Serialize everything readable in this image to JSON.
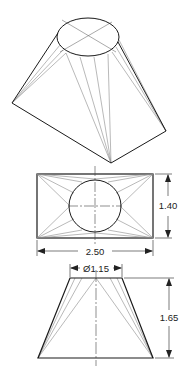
{
  "diagram": {
    "views": {
      "pictorial": {
        "label": "isometric-view"
      },
      "top": {
        "label": "top-view",
        "width_dimension": "2.50",
        "height_dimension": "1.40"
      },
      "front": {
        "label": "front-view",
        "diameter_dimension": "Ø1.15",
        "height_dimension": "1.65"
      }
    },
    "colors": {
      "outline": "#1a1a1a",
      "construction": "#8a8a8a",
      "centerline": "#444444"
    }
  }
}
